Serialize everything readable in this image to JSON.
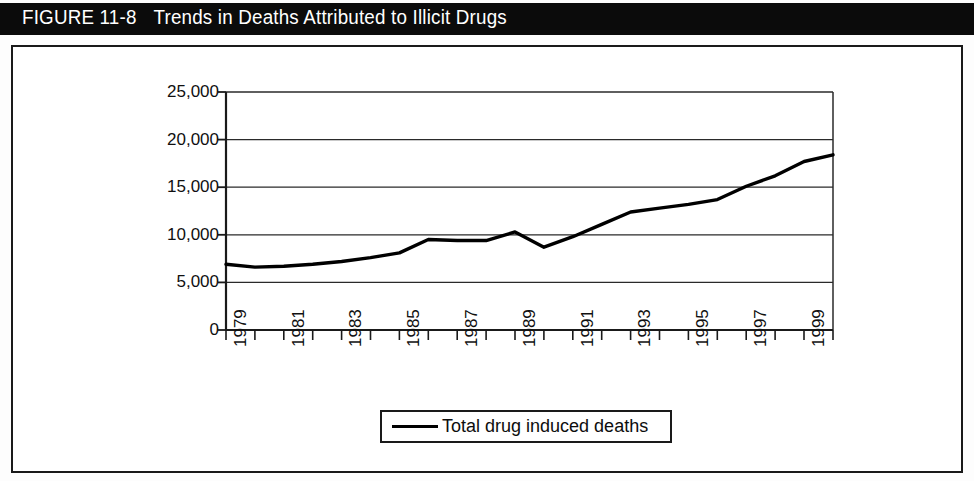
{
  "figure": {
    "label": "FIGURE 11-8",
    "title": "Trends in Deaths Attributed to Illicit Drugs"
  },
  "colors": {
    "title_bar_bg": "#0b0b0b",
    "title_text": "#ffffff",
    "frame_border": "#1a1a1a",
    "axis": "#1a1a1a",
    "gridline": "#2a2a2a",
    "series_line": "#000000",
    "plot_bg": "#ffffff"
  },
  "chart_data": {
    "type": "line",
    "title": "Trends in Deaths Attributed to Illicit Drugs",
    "xlabel": "",
    "ylabel": "",
    "grid": true,
    "legend_position": "bottom",
    "xlim": [
      1979,
      2000
    ],
    "ylim": [
      0,
      25000
    ],
    "ytick_labels": [
      "25,000",
      "20,000",
      "15,000",
      "10,000",
      "5,000",
      "0"
    ],
    "ytick_values": [
      25000,
      20000,
      15000,
      10000,
      5000,
      0
    ],
    "x": [
      1979,
      1980,
      1981,
      1982,
      1983,
      1984,
      1985,
      1986,
      1987,
      1988,
      1989,
      1990,
      1991,
      1992,
      1993,
      1994,
      1995,
      1996,
      1997,
      1998,
      1999,
      2000
    ],
    "xtick_labels": [
      "1979",
      "",
      "1981",
      "",
      "1983",
      "",
      "1985",
      "",
      "1987",
      "",
      "1989",
      "",
      "1991",
      "",
      "1993",
      "",
      "1995",
      "",
      "1997",
      "",
      "1999",
      ""
    ],
    "xtick_labels_shown": [
      "1979",
      "1981",
      "1983",
      "1985",
      "1987",
      "1989",
      "1991",
      "1993",
      "1995",
      "1997",
      "1999"
    ],
    "series": [
      {
        "name": "Total drug induced deaths",
        "values": [
          6900,
          6600,
          6700,
          6900,
          7200,
          7600,
          8100,
          9500,
          9400,
          9400,
          10300,
          8700,
          9800,
          11100,
          12400,
          12800,
          13200,
          13700,
          15100,
          16200,
          17700,
          18400
        ]
      }
    ]
  },
  "legend": {
    "entries": [
      {
        "label": "Total drug induced deaths",
        "marker": "line-swatch"
      }
    ]
  }
}
